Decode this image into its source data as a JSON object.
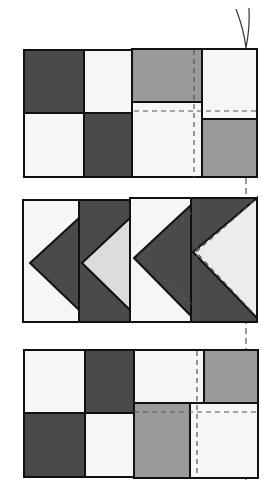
{
  "diagram": {
    "type": "quilt-block-assembly",
    "colors": {
      "dark": "#4a4a4a",
      "medium": "#9a9a9a",
      "light": "#f6f6f6",
      "print": "#dcdcdc",
      "outline": "#111111",
      "stitch": "#555555"
    },
    "rows": [
      {
        "name": "four-patch-row-top",
        "units": [
          "four-patch",
          "four-patch-offset"
        ]
      },
      {
        "name": "flying-geese-row",
        "units": [
          "flying-geese",
          "flying-geese",
          "flying-geese",
          "flying-geese"
        ]
      },
      {
        "name": "four-patch-row-bottom",
        "units": [
          "four-patch",
          "four-patch-offset"
        ]
      }
    ],
    "annotations": [
      "thread-tail",
      "stitch-lines"
    ]
  }
}
